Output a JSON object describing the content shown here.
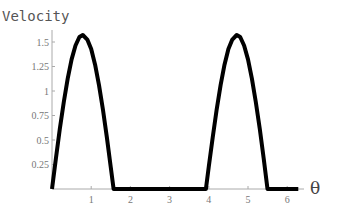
{
  "chart_data": {
    "type": "line",
    "title": "",
    "xlabel": "θ",
    "ylabel": "Velocity",
    "xlim": [
      0,
      6.5
    ],
    "ylim": [
      0,
      1.65
    ],
    "x_ticks": [
      1,
      2,
      3,
      4,
      5,
      6
    ],
    "x_tick_labels": [
      "1",
      "2",
      "3",
      "4",
      "5",
      "6"
    ],
    "y_ticks": [
      0.25,
      0.5,
      0.75,
      1,
      1.25,
      1.5
    ],
    "y_tick_labels": [
      "0.25",
      "0.5",
      "0.75",
      "1",
      "1.25",
      "1.5"
    ],
    "grid": false,
    "legend": null,
    "series": [
      {
        "name": "Velocity",
        "color": "#000000",
        "x": [
          0,
          0.1,
          0.2,
          0.3,
          0.4,
          0.5,
          0.6,
          0.7,
          0.785,
          0.9,
          1.0,
          1.1,
          1.2,
          1.3,
          1.4,
          1.5,
          1.571,
          2.0,
          2.5,
          3.0,
          3.5,
          3.927,
          4.0,
          4.1,
          4.2,
          4.3,
          4.4,
          4.5,
          4.6,
          4.712,
          4.8,
          4.9,
          5.0,
          5.1,
          5.2,
          5.3,
          5.4,
          5.498,
          6.0,
          6.283
        ],
        "y": [
          0,
          0.312,
          0.612,
          0.888,
          1.126,
          1.322,
          1.464,
          1.551,
          1.571,
          1.525,
          1.428,
          1.268,
          1.06,
          0.806,
          0.525,
          0.22,
          0,
          0,
          0,
          0,
          0,
          0,
          0.229,
          0.525,
          0.806,
          1.06,
          1.268,
          1.428,
          1.525,
          1.571,
          1.551,
          1.464,
          1.322,
          1.126,
          0.888,
          0.612,
          0.312,
          0,
          0,
          0
        ]
      }
    ]
  },
  "plot": {
    "x_axis_label": "θ",
    "y_axis_label": "Velocity"
  }
}
